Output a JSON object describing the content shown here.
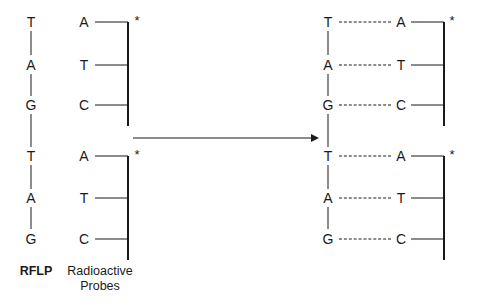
{
  "figure": {
    "background_color": "#ffffff",
    "ink_color": "#1a1a1a"
  },
  "labels": {
    "rflp": "RFLP",
    "probes_line1": "Radioactive",
    "probes_line2": "Probes",
    "asterisk": "*"
  },
  "left_column": {
    "name": "RFLP",
    "bases": [
      "T",
      "A",
      "G",
      "T",
      "A",
      "G"
    ]
  },
  "probe_column": {
    "name": "Radioactive Probes",
    "probes": [
      {
        "bases": [
          "A",
          "T",
          "C"
        ],
        "label_marker": "*"
      },
      {
        "bases": [
          "A",
          "T",
          "C"
        ],
        "label_marker": "*"
      }
    ]
  },
  "hybridized_column": {
    "name": "Hybridized duplex",
    "duplexes": [
      {
        "pairs": [
          {
            "template": "T",
            "probe": "A"
          },
          {
            "template": "A",
            "probe": "T"
          },
          {
            "template": "G",
            "probe": "C"
          }
        ],
        "label_marker": "*"
      },
      {
        "pairs": [
          {
            "template": "T",
            "probe": "A"
          },
          {
            "template": "A",
            "probe": "T"
          },
          {
            "template": "G",
            "probe": "C"
          }
        ],
        "label_marker": "*"
      }
    ]
  },
  "arrow": {
    "name": "hybridization-arrow",
    "direction": "right"
  }
}
